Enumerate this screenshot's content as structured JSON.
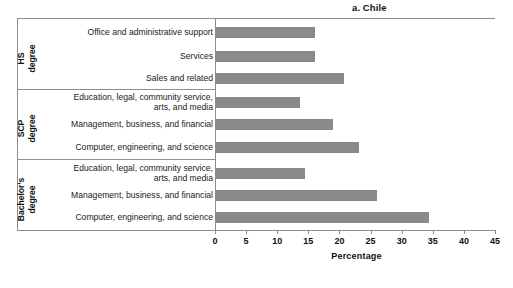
{
  "panel": {
    "title": "a. Chile"
  },
  "axis": {
    "x_title": "Percentage",
    "ticks": [
      0,
      5,
      10,
      15,
      20,
      25,
      30,
      35,
      40,
      45
    ],
    "min": 0,
    "max": 45
  },
  "groups": [
    {
      "id": "hs",
      "label_line1": "HS",
      "label_line2": "degree"
    },
    {
      "id": "scp",
      "label_line1": "SCP",
      "label_line2": "degree"
    },
    {
      "id": "bachelors",
      "label_line1": "Bachelor's",
      "label_line2": "degree"
    }
  ],
  "bar_color": "#8a8a8a",
  "chart_data": {
    "type": "bar",
    "orientation": "horizontal",
    "title": "a. Chile",
    "xlabel": "Percentage",
    "ylabel": "",
    "xlim": [
      0,
      45
    ],
    "xticks": [
      0,
      5,
      10,
      15,
      20,
      25,
      30,
      35,
      40,
      45
    ],
    "grid": false,
    "legend": "none",
    "groups": [
      "HS degree",
      "SCP degree",
      "Bachelor's degree"
    ],
    "categories": [
      "Office and administrative support",
      "Services",
      "Sales and related",
      "Education, legal, community service, arts, and media",
      "Management, business, and financial",
      "Computer, engineering, and science",
      "Education, legal, community service, arts, and media",
      "Management, business, and financial",
      "Computer, engineering, and science"
    ],
    "values": [
      16.1,
      16.1,
      20.8,
      13.7,
      18.9,
      23.1,
      14.4,
      26.0,
      34.4
    ],
    "bars": [
      {
        "group": "HS degree",
        "label_line1": "Office and administrative support",
        "label_line2": "",
        "value": 16.1
      },
      {
        "group": "HS degree",
        "label_line1": "Services",
        "label_line2": "",
        "value": 16.1
      },
      {
        "group": "HS degree",
        "label_line1": "Sales and related",
        "label_line2": "",
        "value": 20.8
      },
      {
        "group": "SCP degree",
        "label_line1": "Education, legal, community service,",
        "label_line2": "arts, and media",
        "value": 13.7
      },
      {
        "group": "SCP degree",
        "label_line1": "Management, business, and financial",
        "label_line2": "",
        "value": 18.9
      },
      {
        "group": "SCP degree",
        "label_line1": "Computer, engineering, and science",
        "label_line2": "",
        "value": 23.1
      },
      {
        "group": "Bachelor's degree",
        "label_line1": "Education, legal, community service,",
        "label_line2": "arts, and media",
        "value": 14.4
      },
      {
        "group": "Bachelor's degree",
        "label_line1": "Management, business, and financial",
        "label_line2": "",
        "value": 26.0
      },
      {
        "group": "Bachelor's degree",
        "label_line1": "Computer, engineering, and science",
        "label_line2": "",
        "value": 34.4
      }
    ]
  }
}
